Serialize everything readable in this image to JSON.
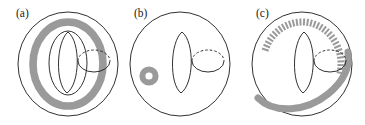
{
  "figure": {
    "background_color": "#ffffff",
    "width": 365,
    "height": 125,
    "line_color": "#1a1a1a",
    "band_color": "#9a9a9a"
  },
  "panels": [
    {
      "id": "panel-a",
      "label": "(a)",
      "label_x": 16,
      "label_y": 17,
      "description": "Torus with a thick gray annulus band following the full longitude, plus a meridian lens curve and a dashed hole circle",
      "torus": {
        "center_x": 68,
        "center_y": 64,
        "outer_rx": 50,
        "outer_ry": 52,
        "inner_rx": 19,
        "inner_ry": 32
      },
      "band": {
        "style": "solid-annulus",
        "color": "#9a9a9a",
        "rx": 35,
        "ry": 42,
        "width": 7.5
      },
      "meridian": {
        "cx": 68,
        "cy": 62,
        "rx": 13,
        "ry": 30,
        "style": "lens"
      },
      "hole_circle": {
        "cx": 94,
        "cy": 61,
        "rx": 16,
        "ry": 11,
        "top": "dashed",
        "bottom": "solid"
      }
    },
    {
      "id": "panel-b",
      "label": "(b)",
      "label_x": 12,
      "label_y": 17,
      "description": "Torus with a meridian lens curve, a dashed hole circle, and a small detached gray annulus at lower left",
      "torus": {
        "center_x": 58,
        "center_y": 64,
        "outer_rx": 50,
        "outer_ry": 52,
        "inner_rx": 0,
        "inner_ry": 0
      },
      "small_annulus": {
        "cx": 27,
        "cy": 76,
        "outer_r": 9.5,
        "inner_r": 3.6,
        "color": "#9a9a9a"
      },
      "meridian": {
        "cx": 60,
        "cy": 62,
        "rx": 13,
        "ry": 30,
        "style": "lens"
      },
      "hole_circle": {
        "cx": 86,
        "cy": 61,
        "rx": 16,
        "ry": 11,
        "top": "dashed",
        "bottom": "solid"
      }
    },
    {
      "id": "panel-c",
      "label": "(c)",
      "label_x": 16,
      "label_y": 17,
      "description": "Torus with a spiralling band: hatched dashed ticks on the upper-left portion transitioning to a solid gray band sweeping to the lower right",
      "torus": {
        "center_x": 62,
        "center_y": 64,
        "outer_rx": 50,
        "outer_ry": 52
      },
      "band": {
        "style": "dashed-to-solid-spiral",
        "color": "#9a9a9a",
        "tick_count": 34,
        "tick_length": 7,
        "solid_width": 7
      },
      "meridian": {
        "cx": 64,
        "cy": 62,
        "rx": 13,
        "ry": 30,
        "style": "lens"
      },
      "hole_circle": {
        "cx": 90,
        "cy": 61,
        "rx": 16,
        "ry": 11,
        "top": "dashed",
        "bottom": "solid"
      }
    }
  ]
}
